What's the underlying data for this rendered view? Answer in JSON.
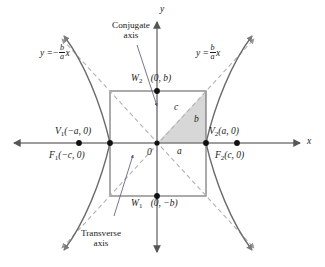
{
  "figure": {
    "name": "hyperbola-standard-form-diagram",
    "axes": {
      "x_label": "x",
      "y_label": "y",
      "origin_label": "0"
    },
    "asymptotes": {
      "left": {
        "prefix": "y =",
        "sign": "−",
        "numerator": "b",
        "denominator": "a",
        "variable": "x"
      },
      "right": {
        "prefix": "y =",
        "sign": "",
        "numerator": "b",
        "denominator": "a",
        "variable": "x"
      }
    },
    "vertices": {
      "left": {
        "name": "V",
        "index": "1",
        "coords": "(−a, 0)"
      },
      "right": {
        "name": "V",
        "index": "2",
        "coords": "(a, 0)"
      }
    },
    "foci": {
      "left": {
        "name": "F",
        "index": "1",
        "coords": "(−c, 0)"
      },
      "right": {
        "name": "F",
        "index": "2",
        "coords": "(c, 0)"
      }
    },
    "covertices": {
      "top": {
        "name": "W",
        "index": "2",
        "coords": "(0, b)"
      },
      "bottom": {
        "name": "W",
        "index": "1",
        "coords": "(0, −b)"
      }
    },
    "annotations": {
      "conjugate_axis_line1": "Conjugate",
      "conjugate_axis_line2": "axis",
      "transverse_axis_line1": "Transverse",
      "transverse_axis_line2": "axis"
    },
    "triangle_labels": {
      "hypotenuse": "c",
      "vertical_leg": "b",
      "horizontal_leg": "a"
    },
    "colors": {
      "curve": "#6b6b6b",
      "axis": "#7d7d7d",
      "box": "#6e6e6e",
      "asymptote": "#b0b0b0",
      "triangle_fill": "#d7d7d7",
      "text": "#1a1a1a",
      "leader": "#6b6b8a",
      "background": "#ffffff"
    }
  }
}
